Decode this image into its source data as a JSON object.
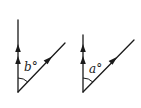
{
  "figures": [
    {
      "id": "left",
      "angle_label": "b°",
      "angle_variable": "b",
      "lines": [
        "vertical-ray-double-arrow",
        "diagonal-ray-single-arrow"
      ]
    },
    {
      "id": "right",
      "angle_label": "a°",
      "angle_variable": "a",
      "lines": [
        "vertical-ray-double-arrow",
        "diagonal-ray-single-arrow"
      ]
    }
  ],
  "colors": {
    "stroke": "#1a1a1a",
    "background": "#ffffff"
  }
}
